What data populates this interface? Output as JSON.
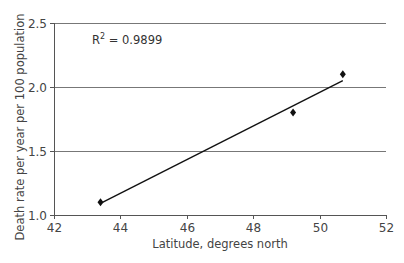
{
  "chart_data": {
    "type": "scatter",
    "title": "",
    "xlabel": "Latitude, degrees north",
    "ylabel": "Death rate per year per 100  population",
    "xlim": [
      42,
      52
    ],
    "ylim": [
      1.0,
      2.5
    ],
    "x_ticks": [
      42,
      44,
      46,
      48,
      50,
      52
    ],
    "x_tick_labels": [
      "42",
      "44",
      "46",
      "48",
      "50",
      "52"
    ],
    "y_ticks": [
      1.0,
      1.5,
      2.0,
      2.5
    ],
    "y_tick_labels": [
      "1.0",
      "1.5",
      "2.0",
      "2.5"
    ],
    "grid": {
      "horizontal": true,
      "vertical": false
    },
    "legend": null,
    "series": [
      {
        "name": "Death rate",
        "marker": "diamond",
        "color": "#111111",
        "x": [
          43.4,
          49.2,
          50.7
        ],
        "y": [
          1.1,
          1.8,
          2.1
        ]
      }
    ],
    "trendline": {
      "type": "linear",
      "color": "#111111",
      "x": [
        43.4,
        50.7
      ],
      "y": [
        1.09,
        2.05
      ]
    },
    "annotations": [
      {
        "text": "R² = 0.9899",
        "r2_base": "R",
        "r2_sup": "2",
        "r2_value": " = 0.9899"
      }
    ]
  }
}
